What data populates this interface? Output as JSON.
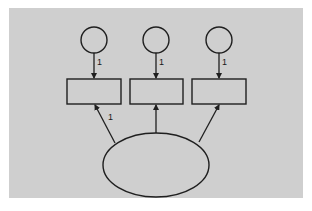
{
  "diagram": {
    "type": "path-diagram",
    "background_color": "#cfcfcf",
    "panel": {
      "x": 9,
      "y": 8,
      "w": 294,
      "h": 190
    },
    "error_terms": [
      {
        "id": "e1",
        "cx": 94,
        "cy": 40,
        "r": 13,
        "path_label": "1"
      },
      {
        "id": "e2",
        "cx": 156,
        "cy": 40,
        "r": 13,
        "path_label": "1"
      },
      {
        "id": "e3",
        "cx": 219,
        "cy": 40,
        "r": 13,
        "path_label": "1"
      }
    ],
    "observed": [
      {
        "id": "x1",
        "x": 67,
        "y": 79,
        "w": 54,
        "h": 25
      },
      {
        "id": "x2",
        "x": 130,
        "y": 79,
        "w": 53,
        "h": 25
      },
      {
        "id": "x3",
        "x": 192,
        "y": 79,
        "w": 54,
        "h": 25
      }
    ],
    "latent": {
      "id": "F",
      "cx": 156,
      "cy": 165,
      "rx": 53,
      "ry": 32
    },
    "loadings": [
      {
        "from": "F",
        "to": "x1",
        "label": "1"
      },
      {
        "from": "F",
        "to": "x2",
        "label": ""
      },
      {
        "from": "F",
        "to": "x3",
        "label": ""
      }
    ]
  }
}
